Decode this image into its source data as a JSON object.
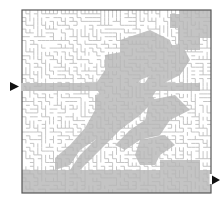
{
  "maze": {
    "grid_cols": 48,
    "grid_rows": 48,
    "origin": [
      22,
      10
    ],
    "size": [
      189,
      183
    ],
    "border_color": "#555555",
    "wall_color": "#b8b8b8",
    "shade_color": "#c4c4c4",
    "background": "#ffffff",
    "entrance": {
      "side": "left",
      "y": 86,
      "label": "start-arrow"
    },
    "exit": {
      "side": "right",
      "y": 180,
      "label": "end-arrow"
    }
  },
  "shaded_regions": [
    [
      [
        22,
        83
      ],
      [
        200,
        83
      ],
      [
        200,
        91
      ],
      [
        22,
        91
      ]
    ],
    [
      [
        22,
        170
      ],
      [
        211,
        170
      ],
      [
        211,
        193
      ],
      [
        22,
        193
      ]
    ],
    [
      [
        180,
        10
      ],
      [
        211,
        10
      ],
      [
        211,
        38
      ],
      [
        195,
        38
      ],
      [
        195,
        30
      ],
      [
        185,
        30
      ],
      [
        185,
        20
      ],
      [
        180,
        20
      ]
    ],
    [
      [
        170,
        14
      ],
      [
        190,
        14
      ],
      [
        190,
        30
      ],
      [
        200,
        30
      ],
      [
        200,
        50
      ],
      [
        185,
        50
      ],
      [
        185,
        60
      ],
      [
        170,
        60
      ],
      [
        170,
        45
      ],
      [
        178,
        45
      ],
      [
        178,
        28
      ],
      [
        170,
        28
      ]
    ],
    [
      [
        105,
        55
      ],
      [
        160,
        45
      ],
      [
        175,
        55
      ],
      [
        165,
        70
      ],
      [
        140,
        80
      ],
      [
        130,
        95
      ],
      [
        115,
        100
      ],
      [
        100,
        95
      ],
      [
        95,
        85
      ],
      [
        105,
        70
      ]
    ],
    [
      [
        120,
        40
      ],
      [
        150,
        30
      ],
      [
        170,
        40
      ],
      [
        175,
        55
      ],
      [
        150,
        55
      ],
      [
        135,
        65
      ],
      [
        120,
        60
      ]
    ],
    [
      [
        95,
        95
      ],
      [
        120,
        90
      ],
      [
        130,
        110
      ],
      [
        110,
        125
      ],
      [
        95,
        140
      ],
      [
        80,
        150
      ],
      [
        70,
        165
      ],
      [
        55,
        170
      ],
      [
        55,
        158
      ],
      [
        70,
        145
      ],
      [
        85,
        128
      ],
      [
        95,
        110
      ]
    ],
    [
      [
        115,
        95
      ],
      [
        145,
        85
      ],
      [
        155,
        100
      ],
      [
        140,
        115
      ],
      [
        120,
        130
      ],
      [
        105,
        145
      ],
      [
        90,
        160
      ],
      [
        80,
        170
      ],
      [
        70,
        170
      ],
      [
        80,
        155
      ],
      [
        95,
        140
      ],
      [
        105,
        125
      ]
    ],
    [
      [
        140,
        60
      ],
      [
        185,
        50
      ],
      [
        190,
        60
      ],
      [
        180,
        75
      ],
      [
        160,
        85
      ],
      [
        150,
        100
      ],
      [
        140,
        90
      ],
      [
        150,
        75
      ]
    ],
    [
      [
        150,
        100
      ],
      [
        175,
        95
      ],
      [
        190,
        110
      ],
      [
        170,
        120
      ],
      [
        160,
        135
      ],
      [
        140,
        140
      ],
      [
        125,
        150
      ],
      [
        115,
        145
      ],
      [
        130,
        130
      ],
      [
        145,
        120
      ]
    ],
    [
      [
        140,
        140
      ],
      [
        165,
        135
      ],
      [
        175,
        145
      ],
      [
        160,
        155
      ],
      [
        155,
        165
      ],
      [
        140,
        165
      ],
      [
        135,
        155
      ]
    ],
    [
      [
        160,
        160
      ],
      [
        200,
        160
      ],
      [
        200,
        170
      ],
      [
        160,
        170
      ]
    ]
  ]
}
